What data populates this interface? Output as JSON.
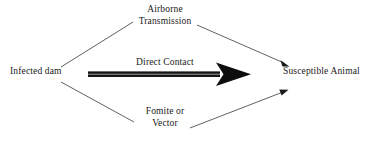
{
  "diagram": {
    "nodes": [
      {
        "id": "source",
        "label": "Infected dam"
      },
      {
        "id": "target",
        "label": "Susceptible Animal"
      }
    ],
    "edges": [
      {
        "id": "airborne",
        "label_line1": "Airborne",
        "label_line2": "Transmission",
        "style": "thin-arrow",
        "route": "upper"
      },
      {
        "id": "direct-contact",
        "label_line1": "Direct Contact",
        "label_line2": "",
        "style": "thick-block-arrow",
        "route": "middle"
      },
      {
        "id": "fomite-vector",
        "label_line1": "Fomite or",
        "label_line2": "Vector",
        "style": "thin-arrow",
        "route": "lower"
      }
    ],
    "colors": {
      "background": "#ffffff",
      "line": "#4a4a4a",
      "line_dark": "#111111",
      "arrow_shaft_highlight": "#8d8d8d",
      "text": "#1a1a1a"
    }
  }
}
